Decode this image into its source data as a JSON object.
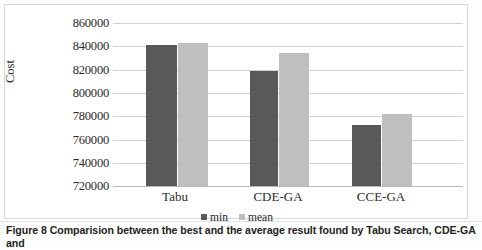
{
  "figure": {
    "caption": "Figure 8 Comparision between the best and the average result found by Tabu Search, CDE-GA and"
  },
  "legend": {
    "items": [
      {
        "label": "min",
        "color": "#595959"
      },
      {
        "label": "mean",
        "color": "#bfbfbf"
      }
    ]
  },
  "axis": {
    "ylabel": "Cost",
    "yticks": [
      "860000",
      "840000",
      "820000",
      "800000",
      "780000",
      "760000",
      "740000",
      "720000"
    ]
  },
  "chart_data": {
    "type": "bar",
    "title": "",
    "xlabel": "",
    "ylabel": "Cost",
    "categories": [
      "Tabu",
      "CDE-GA",
      "CCE-GA"
    ],
    "series": [
      {
        "name": "min",
        "color": "#595959",
        "values": [
          841000,
          818800,
          772000
        ]
      },
      {
        "name": "mean",
        "color": "#bfbfbf",
        "values": [
          843000,
          834300,
          781800
        ]
      }
    ],
    "ylim": [
      720000,
      860000
    ],
    "ytick_step": 20000,
    "grid": true,
    "legend_position": "bottom"
  }
}
